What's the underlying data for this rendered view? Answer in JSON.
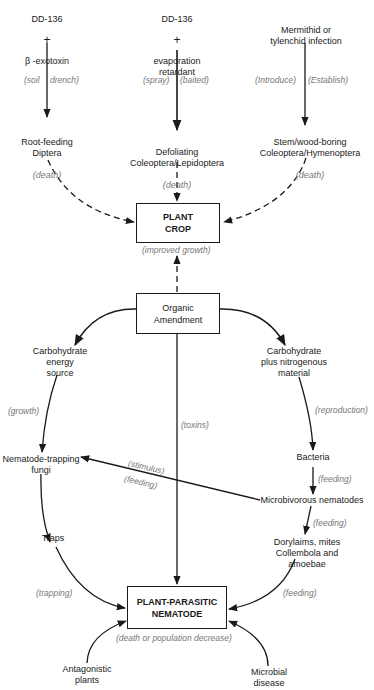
{
  "treatments": [
    {
      "line1": "DD-136",
      "plus": "+",
      "line2": "β -exotoxin"
    },
    {
      "line1": "DD-136",
      "plus": "+",
      "line2": "evaporation\nretardant"
    },
    {
      "line1": "Mermithid or\ntylenchid infection"
    }
  ],
  "treatment_labels": {
    "soil": "(soil",
    "drench": "drench)",
    "spray": "(spray)",
    "baited": "(baited)",
    "introduce": "(Introduce)",
    "establish": "(Establish)"
  },
  "pests": [
    {
      "name": "Root-feeding\nDiptera",
      "effect": "(death)"
    },
    {
      "name": "Defoliating\nColeoptera/Lepidoptera",
      "effect": "(death)"
    },
    {
      "name": "Stem/wood-boring\nColeoptera/Hymenoptera",
      "effect": "(death)"
    }
  ],
  "plant_crop": {
    "label": "PLANT\nCROP",
    "effect": "(improved growth)"
  },
  "organic_amendment": {
    "label": "Organic\nAmendment"
  },
  "left_branch": {
    "source": "Carbohydrate\nenergy\nsource",
    "growth_label": "(growth)",
    "fungi": "Nematode-trapping\nfungi",
    "traps": "Traps",
    "trapping_label": "(trapping)"
  },
  "center_branch": {
    "toxins_label": "(toxins)"
  },
  "right_branch": {
    "source": "Carbohydrate\nplus nitrogenous\nmaterial",
    "reproduction_label": "(reproduction)",
    "bacteria": "Bacteria",
    "feeding_label_1": "(feeding)",
    "microbivorous": "Microbivorous nematodes",
    "feeding_label_2": "(feeding)",
    "predators": "Dorylaims, mites\nCollembola and amoebae",
    "feeding_label_3": "(feeding)"
  },
  "cross_link": {
    "stimulus_label": "(stimulus)",
    "feeding_label": "(feeding)"
  },
  "nematode": {
    "label": "PLANT-PARASITIC\nNEMATODE",
    "effect": "(death or population decrease)"
  },
  "bottom_sources": [
    {
      "name": "Antagonistic\nplants"
    },
    {
      "name": "Microbial\ndisease"
    }
  ]
}
